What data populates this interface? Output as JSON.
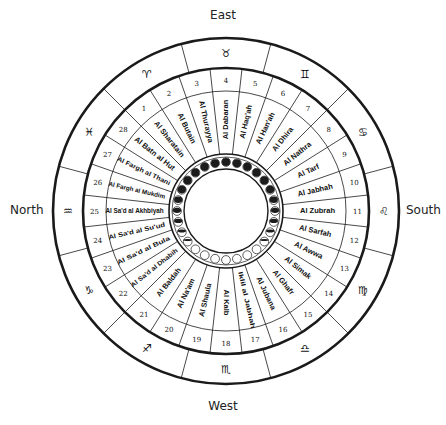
{
  "directions": {
    "east": "East",
    "west": "West",
    "north": "North",
    "south": "South"
  },
  "geometry": {
    "center": [
      226,
      211
    ],
    "r_outer": 173,
    "r_zodiac_inner": 143,
    "r_number_inner": 120,
    "r_moon_outer": 55,
    "r_moon_inner": 42
  },
  "colors": {
    "line": "#1a1a1a",
    "text": "#111111",
    "moon_dark": "#1c1c1c",
    "background": "#ffffff"
  },
  "zodiac": [
    {
      "symbol": "♉",
      "name": "Taurus",
      "angle": 90
    },
    {
      "symbol": "♊",
      "name": "Gemini",
      "angle": 60
    },
    {
      "symbol": "♋",
      "name": "Cancer",
      "angle": 30
    },
    {
      "symbol": "♌",
      "name": "Leo",
      "angle": 0
    },
    {
      "symbol": "♍",
      "name": "Virgo",
      "angle": -30
    },
    {
      "symbol": "♎",
      "name": "Libra",
      "angle": -60
    },
    {
      "symbol": "♏",
      "name": "Scorpio",
      "angle": -90
    },
    {
      "symbol": "♐",
      "name": "Sagittarius",
      "angle": -120
    },
    {
      "symbol": "♑",
      "name": "Capricorn",
      "angle": -150
    },
    {
      "symbol": "♒",
      "name": "Aquarius",
      "angle": 180
    },
    {
      "symbol": "♓",
      "name": "Pisces",
      "angle": 150
    },
    {
      "symbol": "♈",
      "name": "Aries",
      "angle": 120
    }
  ],
  "mansions": [
    {
      "number": "1",
      "name": "Al Sharatain"
    },
    {
      "number": "2",
      "name": "Al Butain"
    },
    {
      "number": "3",
      "name": "Al Thurayya"
    },
    {
      "number": "4",
      "name": "Al Dabaran"
    },
    {
      "number": "5",
      "name": "Al Haq'ah"
    },
    {
      "number": "6",
      "name": "Al Han'ah"
    },
    {
      "number": "7",
      "name": "Al Dhira"
    },
    {
      "number": "8",
      "name": "Al Nathra"
    },
    {
      "number": "9",
      "name": "Al Tarf"
    },
    {
      "number": "10",
      "name": "Al Jabhah"
    },
    {
      "number": "11",
      "name": "Al Zubrah"
    },
    {
      "number": "12",
      "name": "Al Sarfah"
    },
    {
      "number": "13",
      "name": "Al Awwa"
    },
    {
      "number": "14",
      "name": "Al Simak"
    },
    {
      "number": "15",
      "name": "Al Ghafr"
    },
    {
      "number": "16",
      "name": "Al Jubana"
    },
    {
      "number": "17",
      "name": "Iklil al Jabhah"
    },
    {
      "number": "18",
      "name": "Al Kalb"
    },
    {
      "number": "19",
      "name": "Al Shaula"
    },
    {
      "number": "20",
      "name": "Al Na'am"
    },
    {
      "number": "21",
      "name": "Al Baldah"
    },
    {
      "number": "22",
      "name": "Al Sa'd al Dhabih"
    },
    {
      "number": "23",
      "name": "Al Sa'd al Bula"
    },
    {
      "number": "24",
      "name": "Al Sa'd al Su'ud"
    },
    {
      "number": "25",
      "name": "Al Sa'd al Akhbiyah"
    },
    {
      "number": "26",
      "name": "Al Fargh al Mukdim"
    },
    {
      "number": "27",
      "name": "Al Fargh al Thani"
    },
    {
      "number": "28",
      "name": "Al Batn al Hut"
    }
  ],
  "moon_phases": {
    "count": 28,
    "note": "dark at top (new moon side), light at bottom (full moon side)"
  }
}
